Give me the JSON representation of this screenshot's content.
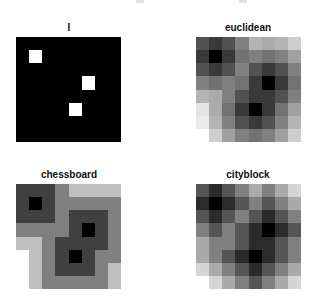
{
  "figure": {
    "background": "#ffffff",
    "colormap": "gray",
    "colormap_low": "#000000",
    "colormap_high": "#ffffff"
  },
  "chart_data": [
    {
      "type": "heatmap",
      "title": "I",
      "rows": 8,
      "cols": 8,
      "max": 1,
      "values": [
        [
          0,
          0,
          0,
          0,
          0,
          0,
          0,
          0
        ],
        [
          0,
          1,
          0,
          0,
          0,
          0,
          0,
          0
        ],
        [
          0,
          0,
          0,
          0,
          0,
          0,
          0,
          0
        ],
        [
          0,
          0,
          0,
          0,
          0,
          1,
          0,
          0
        ],
        [
          0,
          0,
          0,
          0,
          0,
          0,
          0,
          0
        ],
        [
          0,
          0,
          0,
          0,
          1,
          0,
          0,
          0
        ],
        [
          0,
          0,
          0,
          0,
          0,
          0,
          0,
          0
        ],
        [
          0,
          0,
          0,
          0,
          0,
          0,
          0,
          0
        ]
      ],
      "grid": false,
      "axes": "off"
    },
    {
      "type": "heatmap",
      "title": "euclidean",
      "rows": 8,
      "cols": 8,
      "max": 4.472,
      "values": [
        [
          1.414,
          1.0,
          1.414,
          2.236,
          3.162,
          3.0,
          3.162,
          3.606
        ],
        [
          1.0,
          0.0,
          1.0,
          2.0,
          2.236,
          2.0,
          2.236,
          2.828
        ],
        [
          1.414,
          1.0,
          1.414,
          2.236,
          1.414,
          1.0,
          1.414,
          2.236
        ],
        [
          2.236,
          2.0,
          2.236,
          2.0,
          1.0,
          0.0,
          1.0,
          2.0
        ],
        [
          3.162,
          3.0,
          2.236,
          1.414,
          1.0,
          1.0,
          1.414,
          2.236
        ],
        [
          4.0,
          3.0,
          2.0,
          1.0,
          0.0,
          1.0,
          2.0,
          2.828
        ],
        [
          4.123,
          3.162,
          2.236,
          1.414,
          1.0,
          1.414,
          2.236,
          3.162
        ],
        [
          4.472,
          3.606,
          2.828,
          2.236,
          2.0,
          2.236,
          2.828,
          3.606
        ]
      ],
      "grid": false,
      "axes": "off"
    },
    {
      "type": "heatmap",
      "title": "chessboard",
      "rows": 8,
      "cols": 8,
      "max": 4,
      "values": [
        [
          1,
          1,
          1,
          2,
          3,
          3,
          3,
          3
        ],
        [
          1,
          0,
          1,
          2,
          2,
          2,
          2,
          2
        ],
        [
          1,
          1,
          1,
          2,
          1,
          1,
          1,
          2
        ],
        [
          2,
          2,
          2,
          2,
          1,
          0,
          1,
          2
        ],
        [
          3,
          3,
          2,
          1,
          1,
          1,
          1,
          2
        ],
        [
          4,
          3,
          2,
          1,
          0,
          1,
          2,
          2
        ],
        [
          4,
          3,
          2,
          1,
          1,
          1,
          2,
          3
        ],
        [
          4,
          3,
          2,
          2,
          2,
          2,
          2,
          3
        ]
      ],
      "grid": false,
      "axes": "off"
    },
    {
      "type": "heatmap",
      "title": "cityblock",
      "rows": 8,
      "cols": 8,
      "max": 6,
      "values": [
        [
          2,
          1,
          2,
          3,
          4,
          3,
          4,
          5
        ],
        [
          1,
          0,
          1,
          2,
          3,
          2,
          3,
          4
        ],
        [
          2,
          1,
          2,
          3,
          2,
          1,
          2,
          3
        ],
        [
          3,
          2,
          3,
          2,
          1,
          0,
          1,
          2
        ],
        [
          4,
          3,
          3,
          2,
          1,
          1,
          2,
          3
        ],
        [
          4,
          3,
          2,
          1,
          0,
          1,
          2,
          3
        ],
        [
          5,
          4,
          3,
          2,
          1,
          2,
          3,
          4
        ],
        [
          6,
          5,
          4,
          3,
          2,
          3,
          4,
          5
        ]
      ],
      "grid": false,
      "axes": "off"
    }
  ]
}
